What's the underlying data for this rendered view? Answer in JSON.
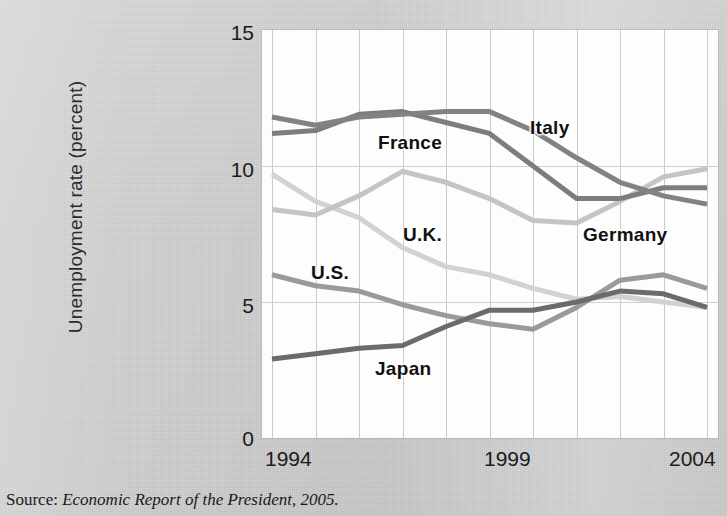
{
  "figure": {
    "source_prefix": "Source:",
    "source_citation": "Economic Report of the President, 2005."
  },
  "axes": {
    "ylabel": "Unemployment rate (percent)",
    "yticks": [
      "0",
      "5",
      "10",
      "15"
    ],
    "xticks": [
      "1994",
      "1999",
      "2004"
    ]
  },
  "series_labels": {
    "france": "France",
    "italy": "Italy",
    "uk": "U.K.",
    "germany": "Germany",
    "us": "U.S.",
    "japan": "Japan"
  },
  "colors": {
    "background": "#d6d6d6",
    "plot_background": "#fdfdfd",
    "grid": "#c9c9c9",
    "france": "#7d7d7d",
    "italy": "#828282",
    "germany": "#c4c4c4",
    "uk": "#d2d2d2",
    "us": "#9a9a9a",
    "japan": "#6b6b6b",
    "text": "#1a1a1a"
  },
  "chart_data": {
    "type": "line",
    "title": "",
    "xlabel": "",
    "ylabel": "Unemployment rate (percent)",
    "x": [
      1994,
      1995,
      1996,
      1997,
      1998,
      1999,
      2000,
      2001,
      2002,
      2003,
      2004
    ],
    "xlim": [
      1994,
      2004
    ],
    "ylim": [
      0,
      15
    ],
    "yticks": [
      0,
      5,
      10,
      15
    ],
    "xticks": [
      1994,
      1999,
      2004
    ],
    "grid": "vertical-major plus horizontal at 5 and 10",
    "legend": "inline series labels on plot",
    "series": [
      {
        "name": "France",
        "color": "#7d7d7d",
        "values": [
          11.2,
          11.3,
          11.9,
          12.0,
          11.6,
          11.2,
          10.0,
          8.8,
          8.8,
          9.2,
          9.2
        ]
      },
      {
        "name": "Italy",
        "color": "#828282",
        "values": [
          11.8,
          11.5,
          11.8,
          11.9,
          12.0,
          12.0,
          11.3,
          10.3,
          9.4,
          8.9,
          8.6
        ]
      },
      {
        "name": "Germany",
        "color": "#c4c4c4",
        "values": [
          8.4,
          8.2,
          8.9,
          9.8,
          9.4,
          8.8,
          8.0,
          7.9,
          8.7,
          9.6,
          9.9
        ]
      },
      {
        "name": "U.K.",
        "color": "#d2d2d2",
        "values": [
          9.7,
          8.7,
          8.1,
          7.0,
          6.3,
          6.0,
          5.5,
          5.1,
          5.2,
          5.0,
          4.8
        ]
      },
      {
        "name": "U.S.",
        "color": "#9a9a9a",
        "values": [
          6.0,
          5.6,
          5.4,
          4.9,
          4.5,
          4.2,
          4.0,
          4.8,
          5.8,
          6.0,
          5.5
        ]
      },
      {
        "name": "Japan",
        "color": "#6b6b6b",
        "values": [
          2.9,
          3.1,
          3.3,
          3.4,
          4.1,
          4.7,
          4.7,
          5.0,
          5.4,
          5.3,
          4.8
        ]
      }
    ]
  }
}
